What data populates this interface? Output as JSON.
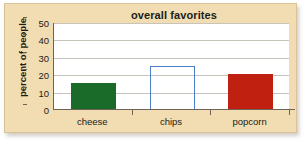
{
  "chart_data": {
    "type": "bar",
    "title": "overall favorites",
    "xlabel": "",
    "ylabel": "percent of people",
    "categories": [
      "cheese",
      "chips",
      "popcorn"
    ],
    "values": [
      15,
      25,
      20
    ],
    "bar_styles": [
      {
        "category": "cheese",
        "fill": "#1a6b2a",
        "style": "filled",
        "outline": "#1a6b2a"
      },
      {
        "category": "chips",
        "fill": "none",
        "style": "outlined",
        "outline": "#4a7fc8"
      },
      {
        "category": "popcorn",
        "fill": "#c0200f",
        "style": "filled",
        "outline": "#c0200f"
      }
    ],
    "ylim": [
      0,
      50
    ],
    "yticks": [
      0,
      10,
      20,
      30,
      40,
      50
    ],
    "ytick_labels": [
      "0",
      "10",
      "20",
      "30",
      "40",
      "50"
    ],
    "grid": true,
    "legend": "none",
    "panel_background": "#f2dcb2",
    "plot_background": "#ffffff",
    "gridline_color": "#c9c4bb",
    "axis_color": "#6e6455",
    "text_color": "#201c17"
  }
}
